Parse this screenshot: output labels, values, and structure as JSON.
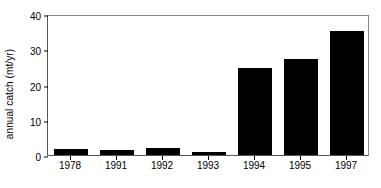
{
  "chart_data": {
    "type": "bar",
    "title": "",
    "subtitle": "",
    "xlabel": "",
    "ylabel": "annual catch (mt/yr)",
    "categories": [
      "1978",
      "1991",
      "1992",
      "1993",
      "1994",
      "1995",
      "1997"
    ],
    "values": [
      1.7,
      1.3,
      1.9,
      0.8,
      24.8,
      27.3,
      35.2
    ],
    "series": [
      {
        "name": "annual catch",
        "values": [
          1.7,
          1.3,
          1.9,
          0.8,
          24.8,
          27.3,
          35.2
        ]
      }
    ],
    "ylim": [
      0,
      40
    ],
    "yticks": [
      0,
      10,
      20,
      30,
      40
    ],
    "ytick_labels": [
      "0",
      "10",
      "20",
      "30",
      "40"
    ],
    "grid": false,
    "legend": null,
    "legend_position": "none",
    "annotations": [],
    "bar_color": "#000000"
  }
}
